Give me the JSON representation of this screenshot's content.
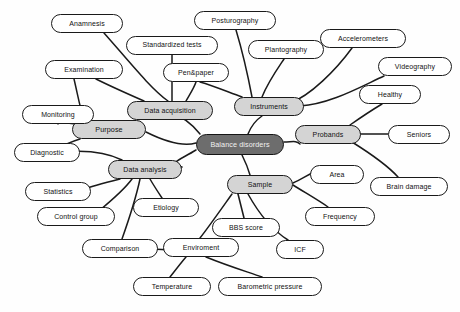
{
  "diagram": {
    "background_color": "#fefefe",
    "colors": {
      "root_fill": "#6d6d6d",
      "root_text": "#f2f2f2",
      "branch_fill": "#d4d4d4",
      "leaf_fill": "#ffffff",
      "stroke": "#1a1a1a",
      "text": "#111111"
    },
    "caption": "",
    "nodes": [
      {
        "id": "balance_disorders",
        "label": "Balance disorders",
        "tier": "root",
        "x": 196,
        "y": 134,
        "w": 88,
        "h": 21,
        "font": 7.2
      },
      {
        "id": "purpose",
        "label": "Purpose",
        "tier": "branch",
        "x": 72,
        "y": 120,
        "w": 74,
        "h": 19,
        "font": 7.2
      },
      {
        "id": "data_acquisition",
        "label": "Data acquisition",
        "tier": "branch",
        "x": 127,
        "y": 101,
        "w": 86,
        "h": 19,
        "font": 7.0
      },
      {
        "id": "instruments",
        "label": "Instruments",
        "tier": "branch",
        "x": 234,
        "y": 97,
        "w": 70,
        "h": 19,
        "font": 7.0
      },
      {
        "id": "probands",
        "label": "Probands",
        "tier": "branch",
        "x": 295,
        "y": 125,
        "w": 66,
        "h": 19,
        "font": 7.0
      },
      {
        "id": "sample",
        "label": "Sample",
        "tier": "branch",
        "x": 227,
        "y": 175,
        "w": 66,
        "h": 19,
        "font": 7.0
      },
      {
        "id": "data_analysis",
        "label": "Data analysis",
        "tier": "branch",
        "x": 108,
        "y": 160,
        "w": 74,
        "h": 19,
        "font": 7.0
      },
      {
        "id": "anamnesis",
        "label": "Anamnesis",
        "tier": "leaf",
        "x": 51,
        "y": 14,
        "w": 72,
        "h": 19,
        "font": 7.0
      },
      {
        "id": "standardized",
        "label": "Standardized tests",
        "tier": "leaf",
        "x": 126,
        "y": 36,
        "w": 92,
        "h": 19,
        "font": 6.9
      },
      {
        "id": "examination",
        "label": "Examination",
        "tier": "leaf",
        "x": 45,
        "y": 60,
        "w": 78,
        "h": 19,
        "font": 7.0
      },
      {
        "id": "penpaper",
        "label": "Pen&paper",
        "tier": "leaf",
        "x": 163,
        "y": 63,
        "w": 66,
        "h": 19,
        "font": 7.0
      },
      {
        "id": "posturography",
        "label": "Posturography",
        "tier": "leaf",
        "x": 194,
        "y": 11,
        "w": 82,
        "h": 19,
        "font": 7.0
      },
      {
        "id": "plantography",
        "label": "Plantography",
        "tier": "leaf",
        "x": 248,
        "y": 40,
        "w": 76,
        "h": 19,
        "font": 7.0
      },
      {
        "id": "accelerometers",
        "label": "Accelerometers",
        "tier": "leaf",
        "x": 320,
        "y": 29,
        "w": 86,
        "h": 19,
        "font": 7.0
      },
      {
        "id": "videography",
        "label": "Videography",
        "tier": "leaf",
        "x": 378,
        "y": 57,
        "w": 74,
        "h": 19,
        "font": 7.0
      },
      {
        "id": "healthy",
        "label": "Healthy",
        "tier": "leaf",
        "x": 359,
        "y": 85,
        "w": 62,
        "h": 19,
        "font": 7.0
      },
      {
        "id": "seniors",
        "label": "Seniors",
        "tier": "leaf",
        "x": 388,
        "y": 125,
        "w": 62,
        "h": 19,
        "font": 7.0
      },
      {
        "id": "brain_damage",
        "label": "Brain damage",
        "tier": "leaf",
        "x": 370,
        "y": 177,
        "w": 78,
        "h": 19,
        "font": 7.0
      },
      {
        "id": "monitoring",
        "label": "Monitoring",
        "tier": "leaf",
        "x": 22,
        "y": 105,
        "w": 72,
        "h": 19,
        "font": 7.0
      },
      {
        "id": "diagnostic",
        "label": "Diagnostic",
        "tier": "leaf",
        "x": 14,
        "y": 143,
        "w": 66,
        "h": 19,
        "font": 7.0
      },
      {
        "id": "statistics",
        "label": "Statistics",
        "tier": "leaf",
        "x": 25,
        "y": 182,
        "w": 66,
        "h": 19,
        "font": 7.0
      },
      {
        "id": "control_group",
        "label": "Control group",
        "tier": "leaf",
        "x": 37,
        "y": 207,
        "w": 78,
        "h": 19,
        "font": 7.0
      },
      {
        "id": "comparison",
        "label": "Comparison",
        "tier": "leaf",
        "x": 82,
        "y": 239,
        "w": 76,
        "h": 19,
        "font": 7.0
      },
      {
        "id": "etiology",
        "label": "Etiology",
        "tier": "leaf",
        "x": 133,
        "y": 198,
        "w": 66,
        "h": 19,
        "font": 7.0
      },
      {
        "id": "enviroment",
        "label": "Enviroment",
        "tier": "leaf",
        "x": 163,
        "y": 238,
        "w": 76,
        "h": 19,
        "font": 7.0
      },
      {
        "id": "temperature",
        "label": "Temperature",
        "tier": "leaf",
        "x": 133,
        "y": 277,
        "w": 78,
        "h": 19,
        "font": 7.0
      },
      {
        "id": "barometric",
        "label": "Barometric pressure",
        "tier": "leaf",
        "x": 218,
        "y": 277,
        "w": 104,
        "h": 19,
        "font": 7.0
      },
      {
        "id": "bbs_score",
        "label": "BBS score",
        "tier": "leaf",
        "x": 212,
        "y": 218,
        "w": 68,
        "h": 19,
        "font": 7.0
      },
      {
        "id": "icf",
        "label": "ICF",
        "tier": "leaf",
        "x": 276,
        "y": 240,
        "w": 48,
        "h": 19,
        "font": 7.0
      },
      {
        "id": "area",
        "label": "Area",
        "tier": "leaf",
        "x": 310,
        "y": 165,
        "w": 54,
        "h": 19,
        "font": 7.0
      },
      {
        "id": "frequency",
        "label": "Frequency",
        "tier": "leaf",
        "x": 305,
        "y": 207,
        "w": 70,
        "h": 19,
        "font": 7.0
      }
    ],
    "edges": [
      {
        "from": "balance_disorders",
        "to": "purpose",
        "d": "M 196 143 C 182 147, 162 140, 146 132"
      },
      {
        "from": "balance_disorders",
        "to": "data_acquisition",
        "d": "M 200 134 C 192 124, 182 116, 170 113"
      },
      {
        "from": "balance_disorders",
        "to": "instruments",
        "d": "M 248 134 C 252 124, 256 120, 262 116"
      },
      {
        "from": "balance_disorders",
        "to": "probands",
        "d": "M 284 142 C 292 142, 296 140, 300 144"
      },
      {
        "from": "balance_disorders",
        "to": "sample",
        "d": "M 242 155 C 246 163, 248 168, 250 175"
      },
      {
        "from": "balance_disorders",
        "to": "data_analysis",
        "d": "M 196 150 C 180 160, 165 164, 182 167"
      },
      {
        "from": "purpose",
        "to": "monitoring",
        "d": "M 76 124 C 66 124, 58 120, 58 124"
      },
      {
        "from": "purpose",
        "to": "diagnostic",
        "d": "M 80 139 C 70 142, 62 146, 56 150"
      },
      {
        "from": "purpose",
        "to": "examination",
        "d": "M 84 120 C 80 108, 78 96, 74 79"
      },
      {
        "from": "data_acquisition",
        "to": "anamnesis",
        "d": "M 168 101 C 150 88, 128 60, 104 33"
      },
      {
        "from": "data_acquisition",
        "to": "standardized",
        "d": "M 172 101 C 172 88, 172 70, 172 55"
      },
      {
        "from": "data_acquisition",
        "to": "examination",
        "d": "M 144 101 C 128 94, 110 86, 96 79"
      },
      {
        "from": "data_acquisition",
        "to": "penpaper",
        "d": "M 186 101 C 190 94, 194 88, 196 82"
      },
      {
        "from": "instruments",
        "to": "posturography",
        "d": "M 252 97 C 248 76, 242 50, 236 30"
      },
      {
        "from": "instruments",
        "to": "plantography",
        "d": "M 262 97 C 268 82, 278 68, 284 59"
      },
      {
        "from": "instruments",
        "to": "penpaper",
        "d": "M 242 97 C 228 92, 214 86, 200 82"
      },
      {
        "from": "instruments",
        "to": "accelerometers",
        "d": "M 290 103 C 310 96, 336 70, 352 48"
      },
      {
        "from": "instruments",
        "to": "videography",
        "d": "M 300 106 C 330 104, 358 88, 384 76"
      },
      {
        "from": "probands",
        "to": "healthy",
        "d": "M 350 125 C 360 118, 372 110, 382 104"
      },
      {
        "from": "probands",
        "to": "seniors",
        "d": "M 358 134 C 368 134, 378 134, 388 134"
      },
      {
        "from": "probands",
        "to": "brain_damage",
        "d": "M 352 142 C 368 152, 388 166, 398 177"
      },
      {
        "from": "data_analysis",
        "to": "statistics",
        "d": "M 120 179 C 108 182, 92 186, 82 190"
      },
      {
        "from": "data_analysis",
        "to": "control_group",
        "d": "M 132 179 C 124 190, 112 200, 100 210"
      },
      {
        "from": "data_analysis",
        "to": "comparison",
        "d": "M 140 179 C 136 198, 128 222, 122 239"
      },
      {
        "from": "data_analysis",
        "to": "etiology",
        "d": "M 150 179 C 154 186, 158 192, 162 198"
      },
      {
        "from": "data_analysis",
        "to": "diagnostic",
        "d": "M 122 160 C 106 152, 84 150, 62 152"
      },
      {
        "from": "sample",
        "to": "bbs_score",
        "d": "M 238 194 C 240 202, 242 210, 244 218"
      },
      {
        "from": "sample",
        "to": "icf",
        "d": "M 248 194 C 258 212, 272 230, 288 240"
      },
      {
        "from": "sample",
        "to": "area",
        "d": "M 293 183 C 300 180, 306 176, 314 172"
      },
      {
        "from": "sample",
        "to": "frequency",
        "d": "M 293 185 C 304 192, 318 200, 328 207"
      },
      {
        "from": "sample",
        "to": "enviroment",
        "d": "M 232 194 C 222 208, 208 228, 200 238"
      },
      {
        "from": "enviroment",
        "to": "temperature",
        "d": "M 186 257 C 180 264, 174 272, 170 277"
      },
      {
        "from": "enviroment",
        "to": "barometric",
        "d": "M 206 257 C 228 266, 248 272, 262 277"
      },
      {
        "from": "enviroment",
        "to": "comparison",
        "d": "M 170 250 C 158 250, 146 248, 138 248"
      }
    ]
  }
}
